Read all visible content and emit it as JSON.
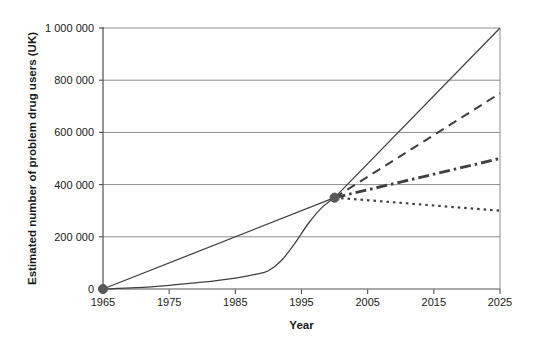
{
  "chart_data": {
    "type": "line",
    "title": "",
    "subtitle": "",
    "xlabel": "Year",
    "ylabel": "Estimated number of problem drug users (UK)",
    "xlim": [
      1965,
      2025
    ],
    "ylim": [
      0,
      1000000
    ],
    "grid": true,
    "grid_axis": "y",
    "legend": false,
    "legend_position": "none",
    "x_ticks": [
      1965,
      1975,
      1985,
      1995,
      2005,
      2015,
      2025
    ],
    "x_tick_labels": [
      "1965",
      "1975",
      "1985",
      "1995",
      "2005",
      "2015",
      "2025"
    ],
    "y_ticks": [
      0,
      200000,
      400000,
      600000,
      800000,
      1000000
    ],
    "y_tick_labels": [
      "0",
      "200 000",
      "400 000",
      "600 000",
      "800 000",
      "1 000 000"
    ],
    "markers": [
      {
        "name": "origin-marker",
        "x": 1965,
        "y": 0
      },
      {
        "name": "convergence-marker",
        "x": 2000,
        "y": 350000
      }
    ],
    "series": [
      {
        "name": "linear-trend",
        "style": "solid",
        "x": [
          1965,
          2000,
          2025
        ],
        "values": [
          0,
          350000,
          1000000
        ]
      },
      {
        "name": "historical-s-curve",
        "style": "solid",
        "x": [
          1965,
          1970,
          1975,
          1980,
          1985,
          1988,
          1990,
          1992,
          1994,
          1996,
          1998,
          2000
        ],
        "values": [
          0,
          5000,
          14000,
          26000,
          42000,
          56000,
          70000,
          110000,
          175000,
          250000,
          310000,
          350000
        ]
      },
      {
        "name": "projection-high-dashed",
        "style": "dashed",
        "x": [
          2000,
          2025
        ],
        "values": [
          350000,
          750000
        ]
      },
      {
        "name": "projection-medium-dashdot",
        "style": "dashdot",
        "x": [
          2000,
          2025
        ],
        "values": [
          350000,
          500000
        ]
      },
      {
        "name": "projection-low-dotted",
        "style": "dotted",
        "x": [
          2000,
          2025
        ],
        "values": [
          350000,
          300000
        ]
      }
    ],
    "colors": {
      "line": "#404040",
      "grid": "#8c8c8c",
      "axis": "#4d4d4d",
      "marker": "#595959",
      "background": "#ffffff"
    }
  }
}
